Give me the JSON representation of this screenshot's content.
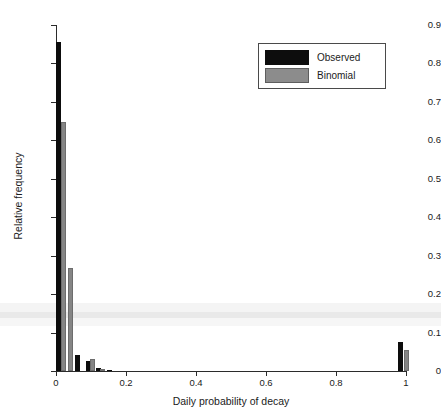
{
  "chart_data": {
    "type": "bar",
    "title": "",
    "xlabel": "Daily probability of decay",
    "ylabel": "Relative frequency",
    "xlim": [
      0,
      1
    ],
    "ylim": [
      0,
      0.9
    ],
    "grid": false,
    "legend_position": "top-right",
    "xticks": [
      "0",
      "0.2",
      "0.4",
      "0.6",
      "0.8",
      "1"
    ],
    "xtick_values": [
      0,
      0.2,
      0.4,
      0.6,
      0.8,
      1
    ],
    "yticks": [
      "0",
      "0.1",
      "0.2",
      "0.3",
      "0.4",
      "0.5",
      "0.6",
      "0.7",
      "0.8",
      "0.9"
    ],
    "ytick_values": [
      0,
      0.1,
      0.2,
      0.3,
      0.4,
      0.5,
      0.6,
      0.7,
      0.8,
      0.9
    ],
    "series": [
      {
        "name": "Observed",
        "color": "#0d0d0d",
        "points": [
          {
            "x": 0.005,
            "y": 0.855
          },
          {
            "x": 0.062,
            "y": 0.042
          },
          {
            "x": 0.092,
            "y": 0.026
          },
          {
            "x": 0.122,
            "y": 0.009
          },
          {
            "x": 0.152,
            "y": 0.003
          },
          {
            "x": 0.985,
            "y": 0.075
          }
        ]
      },
      {
        "name": "Binomial",
        "color": "#858585",
        "points": [
          {
            "x": 0.022,
            "y": 0.647
          },
          {
            "x": 0.042,
            "y": 0.268
          },
          {
            "x": 0.104,
            "y": 0.032
          },
          {
            "x": 0.134,
            "y": 0.004
          },
          {
            "x": 1.0,
            "y": 0.055
          }
        ]
      }
    ]
  },
  "legend": {
    "entries": [
      {
        "label": "Observed",
        "swatch": "observed"
      },
      {
        "label": "Binomial",
        "swatch": "binomial"
      }
    ]
  }
}
